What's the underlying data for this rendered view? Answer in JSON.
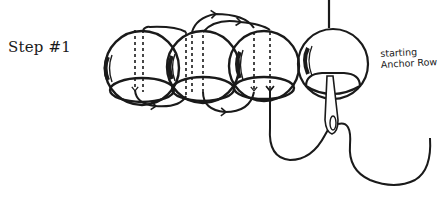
{
  "diagram": {
    "title": "Step #1",
    "step_word": "Step",
    "step_number": "#1",
    "annotation": {
      "line1": "starting",
      "line2": "Anchor Row"
    },
    "elements": {
      "beads": [
        {
          "id": "bead-1",
          "cx": 142,
          "cy": 68,
          "r": 37
        },
        {
          "id": "bead-2",
          "cx": 203,
          "cy": 67,
          "r": 36
        },
        {
          "id": "bead-3",
          "cx": 264,
          "cy": 66,
          "r": 35
        },
        {
          "id": "bead-4",
          "cx": 333,
          "cy": 64,
          "r": 35
        }
      ],
      "needle": {
        "label": "needle",
        "top_y": 0,
        "eye_x": 333,
        "eye_y": 125
      },
      "thread": {
        "label": "thread path with direction arrows",
        "tail_end": [
          430,
          138
        ]
      }
    },
    "colors": {
      "ink": "#1a1a1a",
      "background": "#ffffff"
    }
  }
}
